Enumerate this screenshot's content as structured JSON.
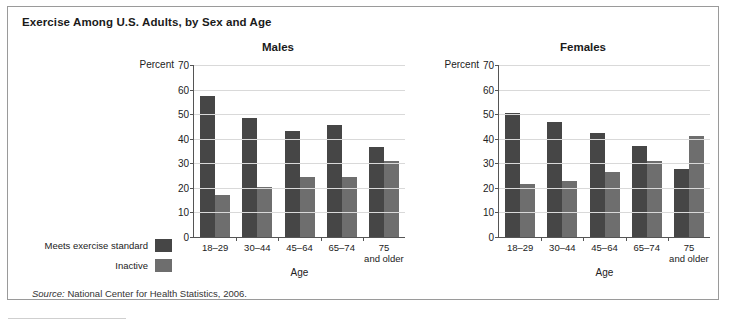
{
  "figure": {
    "title": "Exercise Among U.S. Adults, by Sex and Age",
    "source_prefix": "Source:",
    "source_text": "National Center for Health Statistics, 2006."
  },
  "legend": {
    "items": [
      {
        "label": "Meets exercise standard",
        "color": "#464646"
      },
      {
        "label": "Inactive",
        "color": "#6e6e6e"
      }
    ]
  },
  "axis": {
    "percent_label": "Percent",
    "xlabel": "Age",
    "ticks": [
      "70",
      "60",
      "50",
      "40",
      "30",
      "20",
      "10",
      "0"
    ],
    "categories": [
      "18–29",
      "30–44",
      "45–64",
      "75"
    ],
    "last_category_line1": "75",
    "last_category_line2": "and older"
  },
  "chart_data": [
    {
      "type": "bar",
      "title": "Males",
      "categories": [
        "18–29",
        "30–44",
        "45–64",
        "65–74",
        "75 and older"
      ],
      "series": [
        {
          "name": "Meets exercise standard",
          "values": [
            57.5,
            48.5,
            43,
            45.5,
            36.5
          ],
          "color": "#464646"
        },
        {
          "name": "Inactive",
          "values": [
            17,
            20.5,
            24.5,
            24.5,
            31
          ],
          "color": "#6e6e6e"
        }
      ],
      "xlabel": "Age",
      "ylabel": "Percent",
      "ylim": [
        0,
        70
      ],
      "ytick_step": 10,
      "grid": true,
      "legend_position": "outside-left"
    },
    {
      "type": "bar",
      "title": "Females",
      "categories": [
        "18–29",
        "30–44",
        "45–64",
        "65–74",
        "75 and older"
      ],
      "series": [
        {
          "name": "Meets exercise standard",
          "values": [
            50.5,
            47,
            42.5,
            37,
            27.5
          ],
          "color": "#464646"
        },
        {
          "name": "Inactive",
          "values": [
            21.5,
            23,
            26.5,
            31,
            41
          ],
          "color": "#6e6e6e"
        }
      ],
      "xlabel": "Age",
      "ylabel": "Percent",
      "ylim": [
        0,
        70
      ],
      "ytick_step": 10,
      "grid": true,
      "legend_position": "outside-left"
    }
  ]
}
